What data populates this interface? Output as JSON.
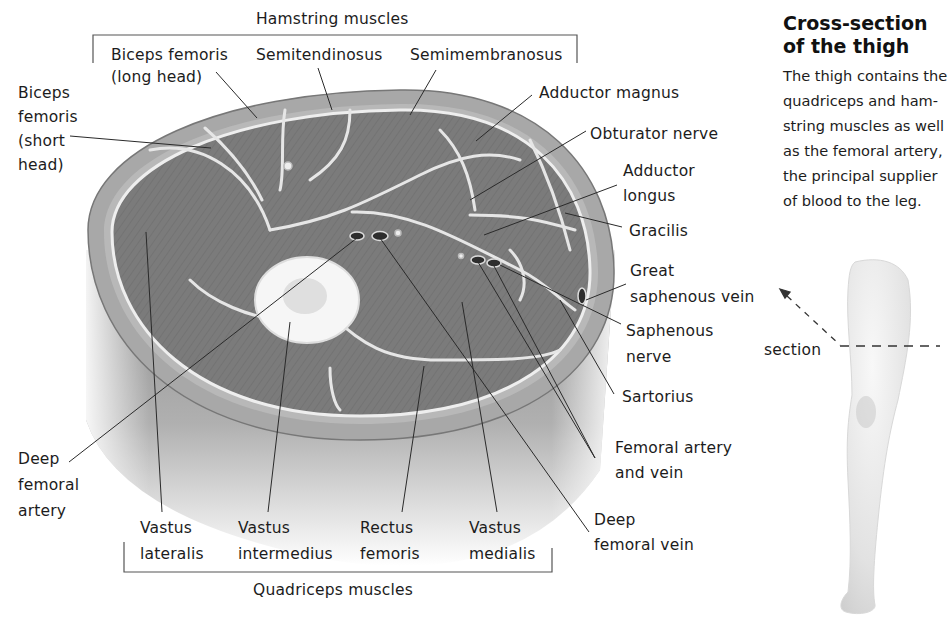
{
  "sidebar_panel": {
    "title": "Cross-section\nof the thigh",
    "description": "The thigh contains the\nquadriceps and ham-\nstring muscles as well\nas the femoral artery,\nthe principal supplier\nof blood to the leg.",
    "section_label": "section"
  },
  "groups": {
    "hamstring": "Hamstring muscles",
    "quadriceps": "Quadriceps muscles"
  },
  "labels": {
    "biceps_long": "Biceps femoris\n(long head)",
    "semitendinosus": "Semitendinosus",
    "semimembranosus": "Semimembranosus",
    "biceps_short": "Biceps\nfemoris\n(short\nhead)",
    "adductor_magnus": "Adductor magnus",
    "obturator_nerve": "Obturator nerve",
    "adductor_longus": "Adductor\nlongus",
    "gracilis": "Gracilis",
    "great_saphenous_vein": "Great\nsaphenous vein",
    "saphenous_nerve": "Saphenous\nnerve",
    "sartorius": "Sartorius",
    "femoral_artery_vein": "Femoral artery\nand vein",
    "deep_femoral_vein": "Deep\nfemoral vein",
    "deep_femoral_artery": "Deep\nfemoral\nartery",
    "vastus_lateralis": "Vastus\nlateralis",
    "vastus_intermedius": "Vastus\nintermedius",
    "rectus_femoris": "Rectus\nfemoris",
    "vastus_medialis": "Vastus\nmedialis"
  },
  "colors": {
    "muscle": "#7a7a7a",
    "fat_layer": "#b4b4b4",
    "fascia": "#e8e8e8",
    "bone": "#f4f4f4",
    "leader_line": "#2a2a2a",
    "text": "#1c1c1c"
  }
}
